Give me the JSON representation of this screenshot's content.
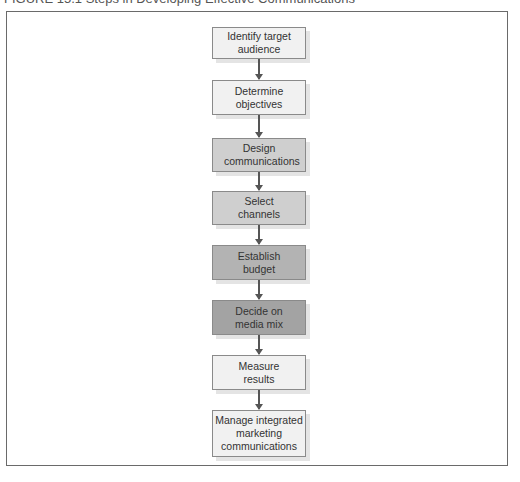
{
  "caption": "FIGURE 15.1 Steps in Developing Effective Communications",
  "steps": [
    {
      "label": "Identify target audience"
    },
    {
      "label": "Determine objectives"
    },
    {
      "label": "Design communications"
    },
    {
      "label": "Select channels"
    },
    {
      "label": "Establish budget"
    },
    {
      "label": "Decide on media mix"
    },
    {
      "label": "Measure results"
    },
    {
      "label": "Manage integrated marketing communications"
    }
  ]
}
